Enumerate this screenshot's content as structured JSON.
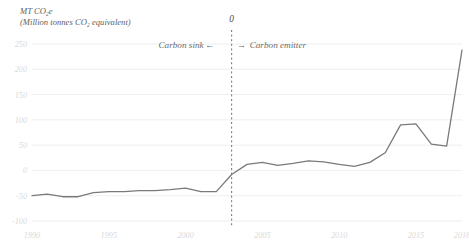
{
  "chart_data": {
    "type": "line",
    "title": "MT CO₂e",
    "subtitle": "(Million tonnes CO₂ equivalent)",
    "xlabel": "",
    "ylabel": "MT CO2e (Million tonnes CO2 equivalent)",
    "xlim": [
      1990,
      2018
    ],
    "ylim": [
      -100,
      250
    ],
    "grid": true,
    "legend_position": "none",
    "yticks": [
      250,
      200,
      150,
      100,
      50,
      0,
      -50,
      -100
    ],
    "ytick_labels": [
      "250",
      "200",
      "150",
      "100",
      "50",
      "0",
      "-50",
      "-100"
    ],
    "xticks": [
      1990,
      1995,
      2000,
      2005,
      2010,
      2015,
      2018
    ],
    "xtick_labels": [
      "1990",
      "1995",
      "2000",
      "2005",
      "2010",
      "2015",
      "2018"
    ],
    "line_color": "#7a7a7a",
    "grid_color": "#f0eef0",
    "x": [
      1990,
      1991,
      1992,
      1993,
      1994,
      1995,
      1996,
      1997,
      1998,
      1999,
      2000,
      2001,
      2002,
      2003,
      2004,
      2005,
      2006,
      2007,
      2008,
      2009,
      2010,
      2011,
      2012,
      2013,
      2014,
      2015,
      2016,
      2017,
      2018
    ],
    "series": [
      {
        "name": "Net forest GHG flux",
        "values": [
          -50,
          -47,
          -52,
          -52,
          -44,
          -42,
          -42,
          -40,
          -40,
          -38,
          -35,
          -42,
          -42,
          -8,
          12,
          16,
          10,
          14,
          19,
          17,
          12,
          8,
          16,
          35,
          90,
          92,
          52,
          48,
          238
        ]
      }
    ],
    "annotations": [
      {
        "name": "zero-reference-label",
        "text": "0",
        "x": 2003,
        "note": "label above dashed vertical reference line"
      },
      {
        "name": "carbon-sink-label",
        "text": "Carbon sink",
        "arrow": "←",
        "side": "left"
      },
      {
        "name": "carbon-emitter-label",
        "text": "Carbon emitter",
        "arrow": "→",
        "side": "right"
      }
    ],
    "reference_line": {
      "name": "vertical-dashed-reference",
      "x": 2003,
      "style": "dashed",
      "color": "#6e6e6e"
    }
  }
}
